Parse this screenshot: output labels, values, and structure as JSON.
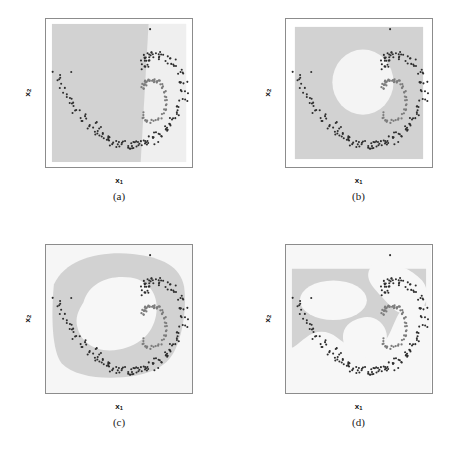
{
  "figure": {
    "background_color": "#ffffff",
    "point_color_class1": "#2e2e2e",
    "point_color_class2": "#7d7d7d",
    "region_color_dark": "#d2d2d2",
    "region_color_light": "#f2f2f2",
    "frame_color": "#8c8c8c"
  },
  "axes": {
    "xlabel": "x",
    "xlabel_sub": "1",
    "ylabel": "x",
    "ylabel_sub": "2",
    "xticks": [
      "-2",
      "-1",
      "0",
      "1"
    ],
    "xtick_values": [
      -2,
      -1,
      0,
      1
    ],
    "yticks": [
      "2",
      "1",
      "0",
      "-1",
      "-2"
    ],
    "ytick_values": [
      2,
      1,
      0,
      -1,
      -2
    ],
    "xlim": [
      -2.65,
      1.55
    ],
    "ylim": [
      -2.25,
      2.55
    ]
  },
  "panels": [
    {
      "id": "a",
      "caption": "(a)",
      "show_xticks": true,
      "show_yticks": true,
      "boundary_type": "linear",
      "boundary_description": "near-vertical linear decision boundary at about x1 = 0.3"
    },
    {
      "id": "b",
      "caption": "(b)",
      "show_xticks": false,
      "show_yticks": false,
      "boundary_type": "elliptical",
      "boundary_description": "single near-circular light region centered at about (0.1, 0.2)"
    },
    {
      "id": "c",
      "caption": "(c)",
      "show_xticks": true,
      "show_yticks": true,
      "boundary_type": "smooth-blob",
      "boundary_description": "large irregular light lobe filling the inner spiral gap"
    },
    {
      "id": "d",
      "caption": "(d)",
      "show_xticks": true,
      "show_yticks": true,
      "boundary_type": "multi-lobed",
      "boundary_description": "several disconnected light lobes carving around both spiral arms"
    }
  ],
  "chart_data": {
    "type": "scatter",
    "title": "",
    "xlabel": "x1",
    "ylabel": "x2",
    "xlim": [
      -2.65,
      1.55
    ],
    "ylim": [
      -2.25,
      2.55
    ],
    "grid": false,
    "legend": "none",
    "n_panels": 4,
    "panel_captions": [
      "(a)",
      "(b)",
      "(c)",
      "(d)"
    ],
    "series": [
      {
        "name": "class-1-outer-spiral",
        "color": "#2e2e2e",
        "marker": "dot",
        "n_points": 200,
        "x": [
          -2.36,
          -2.26,
          -2.18,
          -2.1,
          -2.02,
          -1.95,
          -1.88,
          -1.8,
          -1.72,
          -1.65,
          -1.58,
          -1.52,
          -1.45,
          -1.38,
          -1.3,
          -1.24,
          -1.17,
          -1.1,
          -1.03,
          -0.96,
          -0.9,
          -0.83,
          -0.76,
          -0.7,
          -0.63,
          -0.56,
          -0.5,
          -0.43,
          -0.36,
          -0.3,
          -0.23,
          -0.17,
          -0.1,
          -0.03,
          0.03,
          0.1,
          0.17,
          0.23,
          0.3,
          0.36,
          0.43,
          0.5,
          0.56,
          0.63,
          0.7,
          0.76,
          0.83,
          0.9,
          0.96,
          1.03,
          1.1,
          1.16,
          1.22,
          1.26,
          1.3,
          1.32,
          1.33,
          1.32,
          1.3,
          1.26,
          1.21,
          1.15,
          1.08,
          1.0,
          0.92,
          0.84,
          0.76,
          0.68,
          0.6,
          0.52,
          0.45,
          0.38,
          0.32,
          0.27,
          0.23,
          0.2,
          0.18,
          0.17,
          0.18,
          0.2,
          -2.3,
          -2.2,
          -2.12,
          -2.04,
          -1.97,
          -1.9,
          -1.82,
          -1.74,
          -1.67,
          -1.6,
          -1.53,
          -1.46,
          -1.39,
          -1.32,
          -1.26,
          -1.19,
          -1.12,
          -1.05,
          -0.98,
          -0.92,
          -0.85,
          -0.78,
          -0.72,
          -0.65,
          -0.58,
          -0.52,
          -0.45,
          -0.38,
          -0.32,
          -0.25,
          -0.18,
          -0.12,
          -0.05,
          0.01,
          0.08,
          0.15,
          0.21,
          0.28,
          0.34,
          0.41,
          0.48,
          0.54,
          0.61,
          0.68,
          0.74,
          0.81,
          0.88,
          0.94,
          1.01,
          1.08,
          1.14,
          1.2,
          1.24,
          1.28,
          1.31,
          1.33,
          1.33,
          1.31,
          1.28,
          1.24,
          1.18,
          1.12,
          1.05,
          0.97,
          0.89,
          0.81,
          0.73,
          0.65,
          0.57,
          0.49,
          0.42,
          0.35,
          0.29,
          0.25,
          0.21,
          0.19,
          0.17,
          0.18,
          0.19,
          0.22,
          -2.4,
          -2.15,
          -1.85,
          -1.55,
          -1.25,
          -0.95,
          -0.65,
          -0.35,
          -0.05,
          0.25,
          0.55,
          0.85,
          1.15,
          1.28,
          1.0,
          0.7,
          0.4,
          0.24,
          0.3,
          -2.05
        ],
        "y": [
          0.62,
          0.44,
          0.28,
          0.12,
          -0.02,
          -0.16,
          -0.29,
          -0.41,
          -0.52,
          -0.63,
          -0.73,
          -0.82,
          -0.91,
          -0.99,
          -1.06,
          -1.13,
          -1.19,
          -1.25,
          -1.3,
          -1.34,
          -1.38,
          -1.42,
          -1.45,
          -1.48,
          -1.5,
          -1.52,
          -1.53,
          -1.54,
          -1.55,
          -1.55,
          -1.55,
          -1.54,
          -1.53,
          -1.52,
          -1.5,
          -1.48,
          -1.45,
          -1.42,
          -1.38,
          -1.34,
          -1.3,
          -1.25,
          -1.19,
          -1.13,
          -1.06,
          -0.99,
          -0.91,
          -0.82,
          -0.73,
          -0.63,
          -0.52,
          -0.41,
          -0.29,
          -0.16,
          -0.02,
          0.12,
          0.28,
          0.44,
          0.62,
          0.78,
          0.92,
          1.03,
          1.12,
          1.19,
          1.25,
          1.3,
          1.34,
          1.37,
          1.39,
          1.4,
          1.4,
          1.39,
          1.37,
          1.34,
          1.3,
          1.25,
          1.19,
          1.12,
          1.05,
          0.98,
          0.85,
          0.6,
          0.4,
          0.22,
          0.06,
          -0.08,
          -0.21,
          -0.33,
          -0.45,
          -0.56,
          -0.66,
          -0.76,
          -0.85,
          -0.93,
          -1.01,
          -1.08,
          -1.14,
          -1.2,
          -1.25,
          -1.3,
          -1.34,
          -1.38,
          -1.41,
          -1.44,
          -1.47,
          -1.49,
          -1.51,
          -1.52,
          -1.53,
          -1.54,
          -1.54,
          -1.54,
          -1.53,
          -1.52,
          -1.5,
          -1.48,
          -1.46,
          -1.43,
          -1.39,
          -1.35,
          -1.31,
          -1.26,
          -1.21,
          -1.15,
          -1.08,
          -1.01,
          -0.93,
          -0.85,
          -0.76,
          -0.66,
          -0.55,
          -0.44,
          -0.32,
          -0.19,
          -0.05,
          0.09,
          0.25,
          0.41,
          0.58,
          0.75,
          0.9,
          1.02,
          1.11,
          1.18,
          1.24,
          1.29,
          1.33,
          1.36,
          1.38,
          1.39,
          1.4,
          1.39,
          1.37,
          1.34,
          1.3,
          1.25,
          1.19,
          1.12,
          1.04,
          0.96,
          0.95,
          0.5,
          0.0,
          -0.5,
          -0.9,
          -1.25,
          -1.45,
          -1.55,
          -1.52,
          -1.44,
          -1.22,
          -0.88,
          -0.35,
          0.52,
          1.22,
          1.4,
          1.36,
          1.1,
          2.3,
          0.8
        ]
      },
      {
        "name": "class-2-inner-spiral",
        "color": "#7d7d7d",
        "marker": "dot",
        "n_points": 60,
        "x": [
          0.1,
          0.14,
          0.19,
          0.24,
          0.29,
          0.34,
          0.39,
          0.44,
          0.49,
          0.53,
          0.58,
          0.62,
          0.66,
          0.7,
          0.73,
          0.76,
          0.78,
          0.8,
          0.81,
          0.82,
          0.81,
          0.8,
          0.78,
          0.75,
          0.72,
          0.68,
          0.63,
          0.58,
          0.53,
          0.47,
          0.41,
          0.36,
          0.3,
          0.25,
          0.21,
          0.17,
          0.14,
          0.12,
          0.11,
          0.11,
          0.12,
          0.14,
          0.17,
          0.21,
          0.26,
          0.31,
          0.37,
          0.43,
          0.49,
          0.55,
          0.12,
          0.2,
          0.32,
          0.45,
          0.58,
          0.7,
          0.78,
          0.82,
          0.76,
          0.62
        ],
        "y": [
          0.36,
          0.42,
          0.47,
          0.51,
          0.54,
          0.56,
          0.57,
          0.57,
          0.56,
          0.54,
          0.51,
          0.47,
          0.42,
          0.36,
          0.29,
          0.22,
          0.14,
          0.06,
          -0.02,
          -0.11,
          -0.2,
          -0.28,
          -0.36,
          -0.44,
          -0.51,
          -0.57,
          -0.63,
          -0.68,
          -0.72,
          -0.75,
          -0.77,
          -0.78,
          -0.78,
          -0.77,
          -0.75,
          -0.72,
          -0.68,
          -0.63,
          -0.58,
          -0.52,
          0.3,
          0.37,
          0.44,
          0.49,
          0.53,
          0.55,
          0.55,
          0.54,
          0.51,
          0.47,
          0.28,
          0.4,
          0.52,
          0.56,
          0.52,
          0.4,
          0.2,
          -0.05,
          -0.4,
          -0.68
        ]
      }
    ]
  }
}
